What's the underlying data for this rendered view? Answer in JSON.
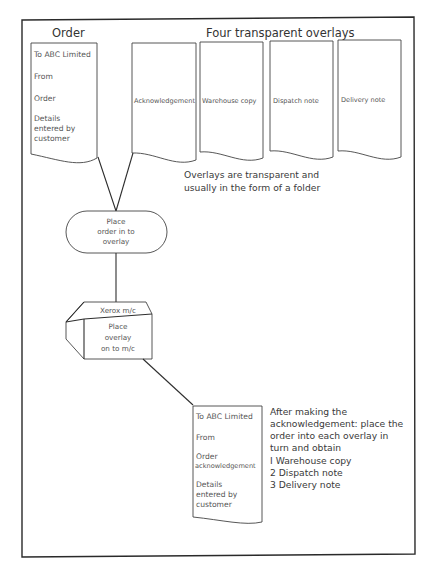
{
  "order_document": {
    "title": "Order",
    "lines": [
      "To ABC Limited",
      "From",
      "Order",
      "Details",
      "entered by",
      "customer"
    ]
  },
  "overlays": {
    "title": "Four transparent overlays",
    "items": [
      "Acknowledgement",
      "Warehouse copy",
      "Dispatch note",
      "Delivery note"
    ],
    "note_lines": [
      "Overlays are transparent and",
      "usually in the form of a folder"
    ]
  },
  "process_place_order": {
    "lines": [
      "Place",
      "order in to",
      "overlay"
    ]
  },
  "xerox_machine": {
    "label": "Xerox m/c",
    "lines": [
      "Place",
      "overlay",
      "on to m/c"
    ]
  },
  "output_document": {
    "lines": [
      "To ABC Limited",
      "From",
      "Order",
      "acknowledgement",
      "Details",
      "entered by",
      "customer"
    ]
  },
  "instructions": {
    "lines": [
      "After making the",
      "acknowledgement: place the",
      "order into each overlay in",
      "turn and obtain"
    ],
    "list": [
      " I Warehouse copy",
      "2 Dispatch note",
      "3 Delivery note"
    ]
  }
}
